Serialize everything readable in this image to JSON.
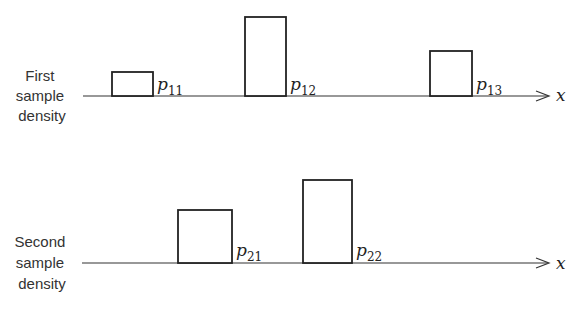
{
  "rows": [
    {
      "label_lines": [
        "First",
        "sample",
        "density"
      ],
      "axis_label": "x",
      "pulses": [
        {
          "symbol": "p",
          "subscript": "11",
          "relative_height": 0.3
        },
        {
          "symbol": "p",
          "subscript": "12",
          "relative_height": 1.0
        },
        {
          "symbol": "p",
          "subscript": "13",
          "relative_height": 0.57
        }
      ]
    },
    {
      "label_lines": [
        "Second",
        "sample",
        "density"
      ],
      "axis_label": "x",
      "pulses": [
        {
          "symbol": "p",
          "subscript": "21",
          "relative_height": 0.67
        },
        {
          "symbol": "p",
          "subscript": "22",
          "relative_height": 1.0
        }
      ]
    }
  ]
}
